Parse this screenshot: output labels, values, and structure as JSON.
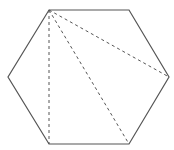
{
  "diagram": {
    "type": "hexagon-diagonals",
    "stroke_color": "#555555",
    "dash_color": "#555555",
    "vertices": [
      {
        "name": "top-left",
        "x": 49,
        "y": 10
      },
      {
        "name": "top-right",
        "x": 129,
        "y": 10
      },
      {
        "name": "right",
        "x": 169,
        "y": 77
      },
      {
        "name": "bottom-right",
        "x": 129,
        "y": 144
      },
      {
        "name": "bottom-left",
        "x": 49,
        "y": 144
      },
      {
        "name": "left",
        "x": 8,
        "y": 77
      }
    ],
    "diagonals": [
      {
        "from": "top-left",
        "to": "bottom-left",
        "style": "dashed"
      },
      {
        "from": "top-left",
        "to": "bottom-right",
        "style": "dashed"
      },
      {
        "from": "top-left",
        "to": "right",
        "style": "dashed"
      }
    ]
  }
}
